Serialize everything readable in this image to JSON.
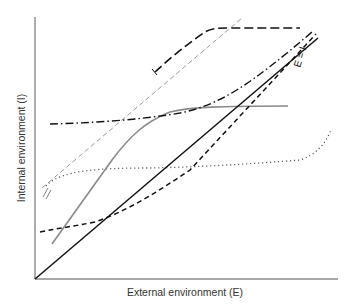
{
  "diagram": {
    "xlabel": "External environment (E)",
    "ylabel": "Internal environment (I)",
    "identity_label": "E = I",
    "curves": [
      {
        "id": "identity",
        "style": "solid",
        "color": "#111111",
        "description": "E = I reference line"
      },
      {
        "id": "short-dashed",
        "style": "dashed",
        "color": "#111111",
        "description": "nearly conformer, slightly above E=I at low E"
      },
      {
        "id": "dash-dot",
        "style": "dash-dot",
        "color": "#111111",
        "description": "partial regulator converging to E=I at high E"
      },
      {
        "id": "long-dashed",
        "style": "long-dash",
        "color": "#111111",
        "description": "regulator at high level, with lower limit marker"
      },
      {
        "id": "thin-gray-dashed",
        "style": "dashed-thin",
        "color": "#888888",
        "description": "parallel steep line"
      },
      {
        "id": "gray-solid",
        "style": "solid",
        "color": "#8a8a8a",
        "description": "conformer at low E, regulator at high E"
      },
      {
        "id": "dotted",
        "style": "dotted",
        "color": "#555555",
        "description": "regulator over wide range with limit marker"
      }
    ]
  }
}
